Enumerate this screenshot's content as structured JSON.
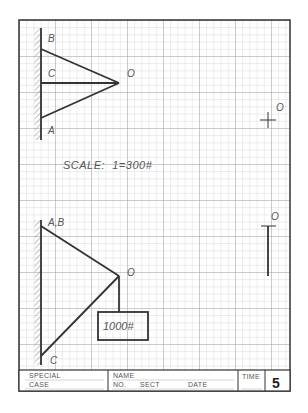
{
  "sheet": {
    "type": "graph-paper worksheet",
    "grid": {
      "minor_spacing_px": 7.2,
      "major_every": 5,
      "minor_color": "#cfcfcf",
      "major_color": "#a8a8a8",
      "frame_color": "#333333"
    }
  },
  "upper_diagram": {
    "labels": {
      "B": "B",
      "C": "C",
      "A": "A",
      "O": "O"
    },
    "members": [
      "B-O",
      "C-O",
      "A-O"
    ]
  },
  "right_marks": {
    "upper_point_label": "O",
    "lower_point_label": "O"
  },
  "scale": {
    "text": "SCALE:  1=300#"
  },
  "lower_diagram": {
    "labels": {
      "AB": "A,B",
      "O": "O",
      "C": "C"
    },
    "load_label": "1000#",
    "members": [
      "AB-O",
      "C-O",
      "O-load"
    ]
  },
  "title_block": {
    "special": "SPECIAL",
    "case": "CASE",
    "name": "NAME",
    "no": "NO.",
    "sect": "SECT",
    "date": "DATE",
    "time": "TIME",
    "number": "5"
  }
}
